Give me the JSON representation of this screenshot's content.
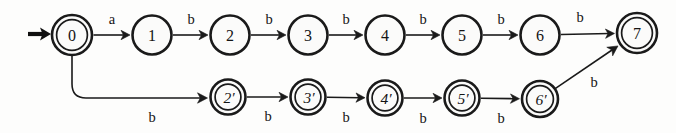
{
  "diagram": {
    "kind": "finite-state-automaton",
    "title": "",
    "canvas": {
      "width": 676,
      "height": 133
    },
    "start_state": "0",
    "alphabet": [
      "a",
      "b"
    ],
    "states": [
      {
        "id": "q0",
        "label": "0",
        "x": 72,
        "y": 35,
        "r": 20,
        "accepting": true,
        "prime": false,
        "row": "top"
      },
      {
        "id": "q1",
        "label": "1",
        "x": 152,
        "y": 35,
        "r": 19.5,
        "accepting": false,
        "prime": false,
        "row": "top"
      },
      {
        "id": "q2",
        "label": "2",
        "x": 230,
        "y": 35,
        "r": 19.5,
        "accepting": false,
        "prime": false,
        "row": "top"
      },
      {
        "id": "q3",
        "label": "3",
        "x": 308,
        "y": 35,
        "r": 19.5,
        "accepting": false,
        "prime": false,
        "row": "top"
      },
      {
        "id": "q4",
        "label": "4",
        "x": 385,
        "y": 35,
        "r": 19.5,
        "accepting": false,
        "prime": false,
        "row": "top"
      },
      {
        "id": "q5",
        "label": "5",
        "x": 462,
        "y": 35,
        "r": 19.5,
        "accepting": false,
        "prime": false,
        "row": "top"
      },
      {
        "id": "q6",
        "label": "6",
        "x": 540,
        "y": 35,
        "r": 19.5,
        "accepting": false,
        "prime": false,
        "row": "top"
      },
      {
        "id": "q7",
        "label": "7",
        "x": 637,
        "y": 33,
        "r": 20,
        "accepting": true,
        "prime": false,
        "row": "top"
      },
      {
        "id": "q2p",
        "label": "2′",
        "x": 228,
        "y": 97,
        "r": 17.5,
        "accepting": true,
        "prime": true,
        "row": "bottom"
      },
      {
        "id": "q3p",
        "label": "3′",
        "x": 308,
        "y": 97,
        "r": 17.5,
        "accepting": true,
        "prime": true,
        "row": "bottom"
      },
      {
        "id": "q4p",
        "label": "4′",
        "x": 385,
        "y": 98,
        "r": 17.5,
        "accepting": true,
        "prime": true,
        "row": "bottom"
      },
      {
        "id": "q5p",
        "label": "5′",
        "x": 462,
        "y": 98,
        "r": 17.5,
        "accepting": true,
        "prime": true,
        "row": "bottom"
      },
      {
        "id": "q6p",
        "label": "6′",
        "x": 540,
        "y": 99,
        "r": 18,
        "accepting": true,
        "prime": true,
        "row": "bottom"
      }
    ],
    "transitions": [
      {
        "from": "q0",
        "to": "q1",
        "label": "a",
        "label_x": 112,
        "label_y": 19,
        "style": "straight"
      },
      {
        "from": "q1",
        "to": "q2",
        "label": "b",
        "label_x": 191,
        "label_y": 19,
        "style": "straight"
      },
      {
        "from": "q2",
        "to": "q3",
        "label": "b",
        "label_x": 269,
        "label_y": 19,
        "style": "straight"
      },
      {
        "from": "q3",
        "to": "q4",
        "label": "b",
        "label_x": 346,
        "label_y": 19,
        "style": "straight"
      },
      {
        "from": "q4",
        "to": "q5",
        "label": "b",
        "label_x": 423,
        "label_y": 19,
        "style": "straight"
      },
      {
        "from": "q5",
        "to": "q6",
        "label": "b",
        "label_x": 501,
        "label_y": 19,
        "style": "straight"
      },
      {
        "from": "q6",
        "to": "q7",
        "label": "b",
        "label_x": 580,
        "label_y": 17,
        "style": "straight"
      },
      {
        "from": "q0",
        "to": "q2p",
        "label": "b",
        "label_x": 152,
        "label_y": 117,
        "style": "elbow-down"
      },
      {
        "from": "q2p",
        "to": "q3p",
        "label": "b",
        "label_x": 268,
        "label_y": 116,
        "style": "straight"
      },
      {
        "from": "q3p",
        "to": "q4p",
        "label": "b",
        "label_x": 346,
        "label_y": 117,
        "style": "straight"
      },
      {
        "from": "q4p",
        "to": "q5p",
        "label": "b",
        "label_x": 423,
        "label_y": 118,
        "style": "straight"
      },
      {
        "from": "q5p",
        "to": "q6p",
        "label": "b",
        "label_x": 501,
        "label_y": 118,
        "style": "straight"
      },
      {
        "from": "q6p",
        "to": "q7",
        "label": "b",
        "label_x": 594,
        "label_y": 82,
        "style": "diagonal"
      }
    ],
    "start_marker": {
      "x1": 28,
      "y1": 34,
      "x2": 44,
      "y2": 34,
      "target": "q0"
    },
    "colors": {
      "ink": "#1a1a1a",
      "background": "#fdfdfc",
      "node_fill": "#fbfbfa"
    }
  }
}
